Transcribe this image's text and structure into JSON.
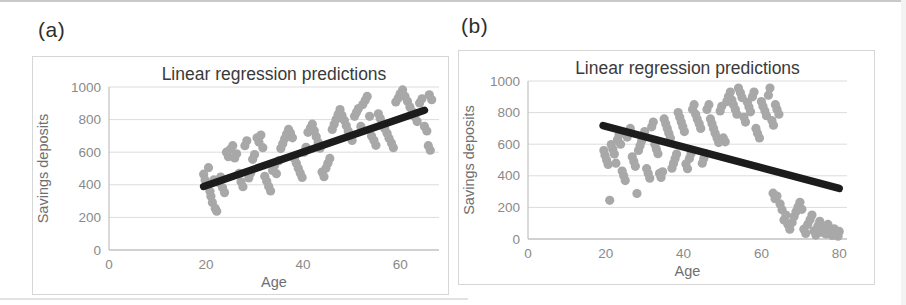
{
  "panels": [
    {
      "label": "(a)"
    },
    {
      "label": "(b)"
    }
  ],
  "colors": {
    "point": "#a8a8a8",
    "trendline": "#1c1c1c",
    "gridline": "#dcdcdc",
    "axis_line": "#c2c2c2",
    "title_text": "#3a3a3a",
    "tick_text": "#8a8a8a",
    "axis_title_text": "#6f6f6f",
    "panel_border": "#d6d6d6"
  },
  "chart_data": [
    {
      "type": "scatter",
      "title": "Linear regression predictions",
      "xlabel": "Age",
      "ylabel": "Savings deposits",
      "xlim": [
        0,
        68
      ],
      "ylim": [
        0,
        1000
      ],
      "xticks": [
        0,
        20,
        40,
        60
      ],
      "yticks": [
        0,
        200,
        400,
        600,
        800,
        1000
      ],
      "grid": "horizontal",
      "legend": "none",
      "trendline": {
        "x": [
          19.5,
          65
        ],
        "y": [
          390,
          857
        ]
      },
      "points": [
        [
          19.5,
          465
        ],
        [
          19.8,
          430
        ],
        [
          20.2,
          398
        ],
        [
          20.5,
          505
        ],
        [
          20.8,
          360
        ],
        [
          21.0,
          330
        ],
        [
          21.3,
          292
        ],
        [
          21.6,
          430
        ],
        [
          21.9,
          255
        ],
        [
          22.2,
          238
        ],
        [
          22.5,
          415
        ],
        [
          23.0,
          448
        ],
        [
          23.4,
          382
        ],
        [
          23.8,
          352
        ],
        [
          24.2,
          600
        ],
        [
          24.6,
          572
        ],
        [
          25.0,
          618
        ],
        [
          25.5,
          640
        ],
        [
          25.9,
          565
        ],
        [
          26.3,
          590
        ],
        [
          26.8,
          470
        ],
        [
          27.2,
          418
        ],
        [
          27.6,
          388
        ],
        [
          28.0,
          640
        ],
        [
          28.4,
          670
        ],
        [
          28.8,
          442
        ],
        [
          29.2,
          472
        ],
        [
          29.6,
          556
        ],
        [
          30.0,
          586
        ],
        [
          30.5,
          688
        ],
        [
          30.9,
          662
        ],
        [
          31.3,
          705
        ],
        [
          31.7,
          628
        ],
        [
          32.1,
          452
        ],
        [
          32.5,
          422
        ],
        [
          32.9,
          390
        ],
        [
          33.3,
          362
        ],
        [
          33.7,
          488
        ],
        [
          34.1,
          518
        ],
        [
          34.5,
          468
        ],
        [
          35.0,
          548
        ],
        [
          35.4,
          622
        ],
        [
          35.8,
          652
        ],
        [
          36.2,
          682
        ],
        [
          36.6,
          712
        ],
        [
          37.0,
          740
        ],
        [
          37.4,
          718
        ],
        [
          37.8,
          688
        ],
        [
          38.2,
          562
        ],
        [
          38.6,
          532
        ],
        [
          39.0,
          502
        ],
        [
          39.4,
          472
        ],
        [
          39.8,
          445
        ],
        [
          40.2,
          600
        ],
        [
          40.6,
          630
        ],
        [
          41.0,
          722
        ],
        [
          41.5,
          748
        ],
        [
          41.9,
          772
        ],
        [
          42.3,
          732
        ],
        [
          42.7,
          695
        ],
        [
          43.1,
          660
        ],
        [
          43.5,
          625
        ],
        [
          43.9,
          478
        ],
        [
          44.3,
          450
        ],
        [
          44.7,
          502
        ],
        [
          45.1,
          532
        ],
        [
          45.5,
          562
        ],
        [
          46.0,
          740
        ],
        [
          46.4,
          772
        ],
        [
          46.8,
          802
        ],
        [
          47.2,
          832
        ],
        [
          47.6,
          862
        ],
        [
          48.0,
          826
        ],
        [
          48.5,
          795
        ],
        [
          48.9,
          762
        ],
        [
          49.3,
          730
        ],
        [
          49.7,
          700
        ],
        [
          50.1,
          672
        ],
        [
          50.6,
          820
        ],
        [
          51.0,
          845
        ],
        [
          51.4,
          868
        ],
        [
          51.9,
          758
        ],
        [
          52.3,
          892
        ],
        [
          52.8,
          918
        ],
        [
          53.2,
          942
        ],
        [
          53.7,
          820
        ],
        [
          54.1,
          700
        ],
        [
          54.6,
          672
        ],
        [
          55.0,
          642
        ],
        [
          55.5,
          836
        ],
        [
          55.9,
          806
        ],
        [
          56.4,
          776
        ],
        [
          56.8,
          746
        ],
        [
          57.3,
          716
        ],
        [
          57.7,
          686
        ],
        [
          58.2,
          656
        ],
        [
          58.6,
          628
        ],
        [
          59.1,
          908
        ],
        [
          59.6,
          932
        ],
        [
          60.0,
          958
        ],
        [
          60.5,
          982
        ],
        [
          61.0,
          942
        ],
        [
          61.5,
          912
        ],
        [
          62.0,
          878
        ],
        [
          62.5,
          848
        ],
        [
          63.0,
          818
        ],
        [
          63.5,
          788
        ],
        [
          64.0,
          902
        ],
        [
          64.5,
          928
        ],
        [
          65.0,
          758
        ],
        [
          65.5,
          730
        ],
        [
          65.8,
          640
        ],
        [
          66.2,
          612
        ],
        [
          66.0,
          952
        ],
        [
          66.5,
          922
        ]
      ]
    },
    {
      "type": "scatter",
      "title": "Linear regression predictions",
      "xlabel": "Age",
      "ylabel": "Savings deposits",
      "xlim": [
        0,
        82
      ],
      "ylim": [
        0,
        1000
      ],
      "xticks": [
        0,
        20,
        40,
        60,
        80
      ],
      "yticks": [
        0,
        200,
        400,
        600,
        800,
        1000
      ],
      "grid": "horizontal",
      "legend": "none",
      "trendline": {
        "x": [
          19.3,
          80
        ],
        "y": [
          718,
          320
        ]
      },
      "points": [
        [
          19.5,
          560
        ],
        [
          19.8,
          530
        ],
        [
          20.2,
          500
        ],
        [
          20.6,
          472
        ],
        [
          21.0,
          245
        ],
        [
          21.4,
          598
        ],
        [
          21.8,
          568
        ],
        [
          22.2,
          538
        ],
        [
          22.6,
          480
        ],
        [
          23.0,
          628
        ],
        [
          23.4,
          658
        ],
        [
          23.8,
          600
        ],
        [
          24.2,
          430
        ],
        [
          24.6,
          400
        ],
        [
          25.0,
          370
        ],
        [
          25.5,
          645
        ],
        [
          25.9,
          672
        ],
        [
          26.3,
          700
        ],
        [
          26.8,
          520
        ],
        [
          27.2,
          490
        ],
        [
          27.6,
          460
        ],
        [
          28.0,
          288
        ],
        [
          28.4,
          560
        ],
        [
          28.8,
          590
        ],
        [
          29.2,
          620
        ],
        [
          29.6,
          650
        ],
        [
          30.0,
          680
        ],
        [
          30.5,
          445
        ],
        [
          30.9,
          415
        ],
        [
          31.3,
          385
        ],
        [
          31.8,
          710
        ],
        [
          32.2,
          740
        ],
        [
          32.6,
          600
        ],
        [
          33.0,
          570
        ],
        [
          33.4,
          540
        ],
        [
          33.8,
          415
        ],
        [
          34.2,
          390
        ],
        [
          34.6,
          425
        ],
        [
          35.0,
          760
        ],
        [
          35.4,
          730
        ],
        [
          35.8,
          700
        ],
        [
          36.2,
          670
        ],
        [
          36.6,
          640
        ],
        [
          37.0,
          448
        ],
        [
          37.4,
          478
        ],
        [
          37.8,
          508
        ],
        [
          38.2,
          538
        ],
        [
          38.6,
          800
        ],
        [
          39.0,
          770
        ],
        [
          39.4,
          740
        ],
        [
          39.8,
          710
        ],
        [
          40.2,
          680
        ],
        [
          40.6,
          475
        ],
        [
          41.0,
          445
        ],
        [
          41.5,
          510
        ],
        [
          41.9,
          540
        ],
        [
          42.3,
          820
        ],
        [
          42.7,
          850
        ],
        [
          43.1,
          790
        ],
        [
          43.5,
          760
        ],
        [
          44.0,
          730
        ],
        [
          44.4,
          700
        ],
        [
          44.8,
          480
        ],
        [
          45.2,
          510
        ],
        [
          45.6,
          540
        ],
        [
          46.0,
          820
        ],
        [
          46.5,
          850
        ],
        [
          46.9,
          760
        ],
        [
          47.3,
          730
        ],
        [
          47.7,
          700
        ],
        [
          48.1,
          670
        ],
        [
          48.6,
          640
        ],
        [
          49.0,
          610
        ],
        [
          49.4,
          810
        ],
        [
          49.8,
          840
        ],
        [
          50.2,
          640
        ],
        [
          50.7,
          615
        ],
        [
          51.1,
          870
        ],
        [
          51.5,
          900
        ],
        [
          52.0,
          930
        ],
        [
          52.4,
          880
        ],
        [
          52.8,
          850
        ],
        [
          53.3,
          820
        ],
        [
          53.7,
          790
        ],
        [
          54.1,
          955
        ],
        [
          54.6,
          925
        ],
        [
          55.0,
          895
        ],
        [
          55.5,
          770
        ],
        [
          55.9,
          740
        ],
        [
          56.4,
          865
        ],
        [
          56.8,
          835
        ],
        [
          57.2,
          805
        ],
        [
          57.7,
          900
        ],
        [
          58.1,
          930
        ],
        [
          58.6,
          700
        ],
        [
          59.0,
          670
        ],
        [
          59.5,
          640
        ],
        [
          60.0,
          870
        ],
        [
          60.4,
          840
        ],
        [
          60.9,
          810
        ],
        [
          61.3,
          780
        ],
        [
          61.8,
          910
        ],
        [
          62.2,
          955
        ],
        [
          62.7,
          750
        ],
        [
          63.1,
          720
        ],
        [
          63.6,
          850
        ],
        [
          64.0,
          820
        ],
        [
          64.5,
          790
        ],
        [
          63.0,
          290
        ],
        [
          63.5,
          255
        ],
        [
          64.0,
          272
        ],
        [
          64.8,
          222
        ],
        [
          65.3,
          185
        ],
        [
          65.8,
          120
        ],
        [
          66.3,
          152
        ],
        [
          66.8,
          92
        ],
        [
          67.3,
          62
        ],
        [
          67.9,
          105
        ],
        [
          68.4,
          142
        ],
        [
          68.9,
          172
        ],
        [
          69.4,
          202
        ],
        [
          69.9,
          232
        ],
        [
          70.4,
          188
        ],
        [
          70.9,
          62
        ],
        [
          71.4,
          35
        ],
        [
          71.9,
          92
        ],
        [
          72.5,
          122
        ],
        [
          73.0,
          152
        ],
        [
          73.5,
          52
        ],
        [
          74.0,
          25
        ],
        [
          74.5,
          82
        ],
        [
          75.0,
          112
        ],
        [
          75.6,
          42
        ],
        [
          76.1,
          72
        ],
        [
          76.6,
          32
        ],
        [
          77.1,
          92
        ],
        [
          77.7,
          52
        ],
        [
          78.2,
          22
        ],
        [
          78.7,
          65
        ],
        [
          79.2,
          38
        ],
        [
          79.7,
          18
        ],
        [
          80.0,
          48
        ]
      ]
    }
  ]
}
